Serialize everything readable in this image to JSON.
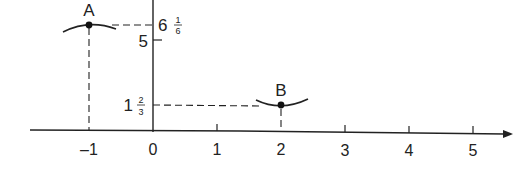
{
  "diagram": {
    "type": "coordinate-plane-points",
    "axes": {
      "x_ticks": [
        "–1",
        "0",
        "1",
        "2",
        "3",
        "4",
        "5"
      ],
      "y_labels": {
        "five": "5",
        "a_whole": "6",
        "a_num": "1",
        "a_den": "6",
        "b_whole": "1",
        "b_num": "2",
        "b_den": "3"
      },
      "y_axis_label": "y"
    },
    "points": [
      {
        "label": "A",
        "x": -1,
        "y": "6 1/6"
      },
      {
        "label": "B",
        "x": 2,
        "y": "1 2/3"
      }
    ],
    "colors": {
      "ink": "#222222",
      "background": "#ffffff"
    }
  }
}
